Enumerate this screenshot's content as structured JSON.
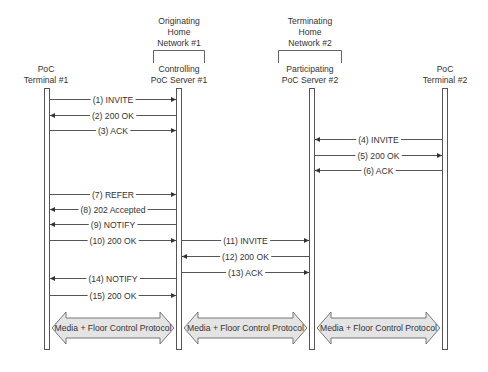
{
  "groups": [
    {
      "id": "originating",
      "label_lines": [
        "Originating",
        "Home",
        "Network #1"
      ]
    },
    {
      "id": "terminating",
      "label_lines": [
        "Terminating",
        "Home",
        "Network #2"
      ]
    }
  ],
  "participants": [
    {
      "id": "t1",
      "label_lines": [
        "PoC",
        "Terminal #1"
      ]
    },
    {
      "id": "cs1",
      "label_lines": [
        "Controlling",
        "PoC Server #1"
      ]
    },
    {
      "id": "ps2",
      "label_lines": [
        "Participating",
        "PoC Server #2"
      ]
    },
    {
      "id": "t2",
      "label_lines": [
        "PoC",
        "Terminal #2"
      ]
    }
  ],
  "messages": [
    {
      "n": 1,
      "label": "(1) INVITE",
      "from": "t1",
      "to": "cs1"
    },
    {
      "n": 2,
      "label": "(2) 200 OK",
      "from": "cs1",
      "to": "t1"
    },
    {
      "n": 3,
      "label": "(3) ACK",
      "from": "t1",
      "to": "cs1"
    },
    {
      "n": 4,
      "label": "(4) INVITE",
      "from": "t2",
      "to": "ps2"
    },
    {
      "n": 5,
      "label": "(5) 200 OK",
      "from": "ps2",
      "to": "t2"
    },
    {
      "n": 6,
      "label": "(6) ACK",
      "from": "t2",
      "to": "ps2"
    },
    {
      "n": 7,
      "label": "(7) REFER",
      "from": "t1",
      "to": "cs1"
    },
    {
      "n": 8,
      "label": "(8) 202 Accepted",
      "from": "cs1",
      "to": "t1"
    },
    {
      "n": 9,
      "label": "(9) NOTIFY",
      "from": "cs1",
      "to": "t1"
    },
    {
      "n": 10,
      "label": "(10) 200 OK",
      "from": "t1",
      "to": "cs1"
    },
    {
      "n": 11,
      "label": "(11) INVITE",
      "from": "cs1",
      "to": "ps2"
    },
    {
      "n": 12,
      "label": "(12) 200 OK",
      "from": "ps2",
      "to": "cs1"
    },
    {
      "n": 13,
      "label": "(13) ACK",
      "from": "cs1",
      "to": "ps2"
    },
    {
      "n": 14,
      "label": "(14) NOTIFY",
      "from": "cs1",
      "to": "t1"
    },
    {
      "n": 15,
      "label": "(15) 200 OK",
      "from": "t1",
      "to": "cs1"
    }
  ],
  "media_flows": [
    {
      "label": "Media + Floor Control Protocol",
      "between": [
        "t1",
        "cs1"
      ]
    },
    {
      "label": "Media + Floor Control Protocol",
      "between": [
        "cs1",
        "ps2"
      ]
    },
    {
      "label": "Media + Floor Control Protocol",
      "between": [
        "ps2",
        "t2"
      ]
    }
  ],
  "colors": {
    "line": "#555555",
    "lifeline_fill": "#ffffff",
    "block_fill": "#e4e4e4",
    "block_stroke": "#777777",
    "text": "#333333"
  }
}
